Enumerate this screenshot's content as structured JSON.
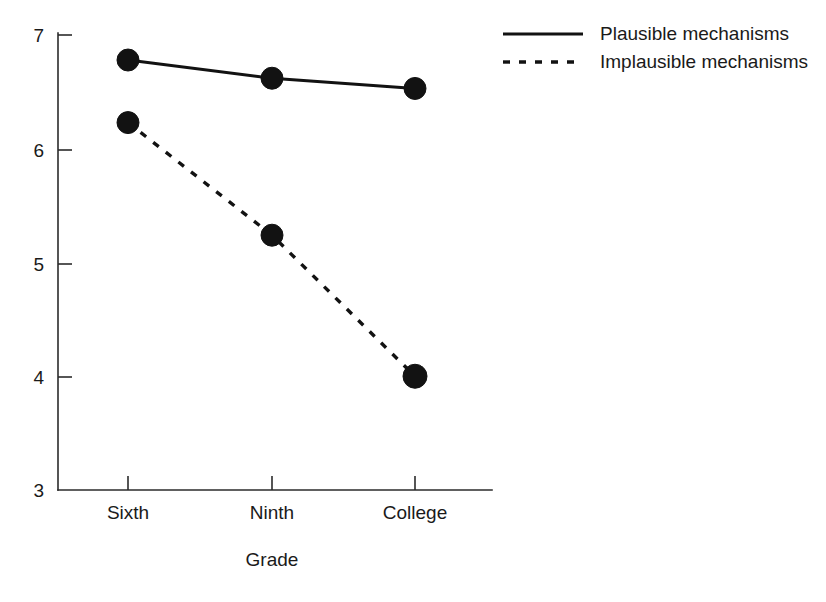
{
  "chart_data": {
    "type": "line",
    "title": "",
    "subtitle": "",
    "xlabel": "Grade",
    "ylabel": "",
    "categories": [
      "Sixth",
      "Ninth",
      "College"
    ],
    "series": [
      {
        "name": "Plausible mechanisms",
        "style": "solid",
        "marker": "filled-circle",
        "color": "#121212",
        "values": [
          6.78,
          6.62,
          6.53
        ]
      },
      {
        "name": "Implausible mechanisms",
        "style": "dashed",
        "marker": "filled-circle",
        "color": "#121212",
        "values": [
          6.23,
          5.24,
          4.0
        ]
      }
    ],
    "ylim": [
      3,
      7
    ],
    "yticks": [
      3,
      4,
      5,
      6,
      7
    ],
    "ytick_labels": [
      "3",
      "4",
      "5",
      "6",
      "7"
    ],
    "xtick_labels": [
      "Sixth",
      "Ninth",
      "College"
    ],
    "grid": false,
    "legend_position": "top-right",
    "legend_entries": [
      {
        "label": "Plausible mechanisms",
        "style": "solid"
      },
      {
        "label": "Implausible mechanisms",
        "style": "dashed"
      }
    ]
  },
  "axes": {
    "x_axis_label": "Grade",
    "y_axis_label": "",
    "y_tick_0": "3",
    "y_tick_1": "4",
    "y_tick_2": "5",
    "y_tick_3": "6",
    "y_tick_4": "7",
    "x_tick_0": "Sixth",
    "x_tick_1": "Ninth",
    "x_tick_2": "College"
  },
  "legend": {
    "entry_0_label": "Plausible mechanisms",
    "entry_1_label": "Implausible mechanisms"
  },
  "colors": {
    "ink": "#121212",
    "axis": "#2b2b2b",
    "background": "#ffffff"
  }
}
